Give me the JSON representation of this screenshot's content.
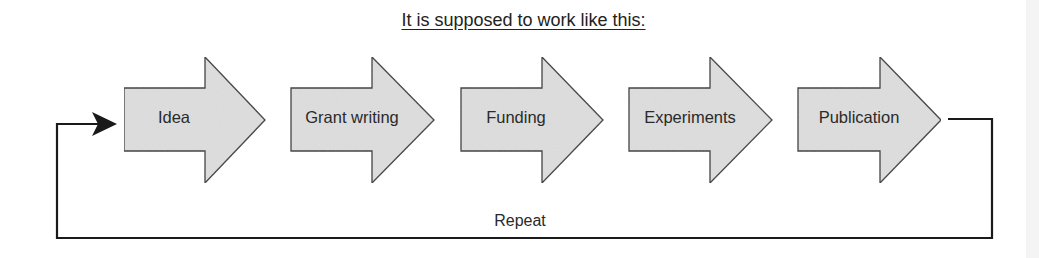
{
  "title": "It is supposed to work like this:",
  "steps": [
    {
      "label": "Idea"
    },
    {
      "label": "Grant writing"
    },
    {
      "label": "Funding"
    },
    {
      "label": "Experiments"
    },
    {
      "label": "Publication"
    }
  ],
  "loop": {
    "label": "Repeat"
  },
  "colors": {
    "arrow_fill": "#dedede",
    "arrow_stroke": "#3a3a3a",
    "line": "#1a1a1a"
  }
}
